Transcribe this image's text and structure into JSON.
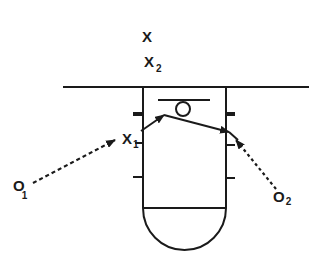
{
  "diagram": {
    "labels": {
      "x": "X",
      "x2_main": "X",
      "x2_sub": "2",
      "x1_main": "X",
      "x1_sub": "1",
      "o1_main": "O",
      "o1_sub": "1",
      "o2_main": "O",
      "o2_sub": "2"
    },
    "colors": {
      "stroke": "#1a1a1a",
      "background": "#ffffff"
    }
  }
}
